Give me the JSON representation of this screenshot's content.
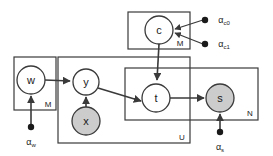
{
  "diagram": {
    "type": "plate-notation-graphical-model",
    "background_color": "#ffffff",
    "stroke_color": "#3a3a3a",
    "observed_fill": "#cccccc",
    "latent_fill": "#ffffff",
    "nodes": [
      {
        "id": "c",
        "label": "c",
        "shaded": false,
        "cx": 159,
        "cy": 30,
        "r": 14
      },
      {
        "id": "w",
        "label": "w",
        "shaded": false,
        "cx": 31,
        "cy": 80,
        "r": 14
      },
      {
        "id": "y",
        "label": "y",
        "shaded": false,
        "cx": 86,
        "cy": 82,
        "r": 13
      },
      {
        "id": "x",
        "label": "x",
        "shaded": true,
        "cx": 86,
        "cy": 121,
        "r": 14
      },
      {
        "id": "t",
        "label": "t",
        "shaded": false,
        "cx": 156,
        "cy": 98,
        "r": 14
      },
      {
        "id": "s",
        "label": "s",
        "shaded": true,
        "cx": 220,
        "cy": 98,
        "r": 14
      }
    ],
    "plates": [
      {
        "id": "plate-c",
        "label": "M",
        "x": 128,
        "y": 12,
        "w": 62,
        "h": 37,
        "label_x": 180,
        "label_y": 43
      },
      {
        "id": "plate-w",
        "label": "M",
        "x": 14,
        "y": 57,
        "w": 42,
        "h": 53,
        "label_x": 48,
        "label_y": 104
      },
      {
        "id": "plate-u",
        "label": "U",
        "x": 58,
        "y": 57,
        "w": 132,
        "h": 86,
        "label_x": 182,
        "label_y": 137
      },
      {
        "id": "plate-n",
        "label": "N",
        "x": 125,
        "y": 68,
        "w": 133,
        "h": 52,
        "label_x": 250,
        "label_y": 113
      }
    ],
    "hyperparameters": [
      {
        "id": "alpha-c0",
        "symbol": "α",
        "subscript": "c0",
        "dot_x": 205,
        "dot_y": 20,
        "label_x": 224,
        "label_y": 20
      },
      {
        "id": "alpha-c1",
        "symbol": "α",
        "subscript": "c1",
        "dot_x": 205,
        "dot_y": 44,
        "label_x": 224,
        "label_y": 44
      },
      {
        "id": "alpha-w",
        "symbol": "α",
        "subscript": "w",
        "dot_x": 31,
        "dot_y": 127,
        "label_x": 31,
        "label_y": 142
      },
      {
        "id": "alpha-s",
        "symbol": "α",
        "subscript": "s",
        "dot_x": 220,
        "dot_y": 132,
        "label_x": 220,
        "label_y": 147
      }
    ],
    "edges": [
      {
        "id": "edge-alpha-c0-to-c",
        "from": "alpha-c0",
        "to": "c"
      },
      {
        "id": "edge-alpha-c1-to-c",
        "from": "alpha-c1",
        "to": "c"
      },
      {
        "id": "edge-c-to-t",
        "from": "c",
        "to": "t"
      },
      {
        "id": "edge-alpha-w-to-w",
        "from": "alpha-w",
        "to": "w"
      },
      {
        "id": "edge-w-to-y",
        "from": "w",
        "to": "y"
      },
      {
        "id": "edge-x-to-y",
        "from": "x",
        "to": "y"
      },
      {
        "id": "edge-y-to-t",
        "from": "y",
        "to": "t"
      },
      {
        "id": "edge-t-to-s",
        "from": "t",
        "to": "s"
      },
      {
        "id": "edge-alpha-s-to-s",
        "from": "alpha-s",
        "to": "s"
      }
    ]
  }
}
